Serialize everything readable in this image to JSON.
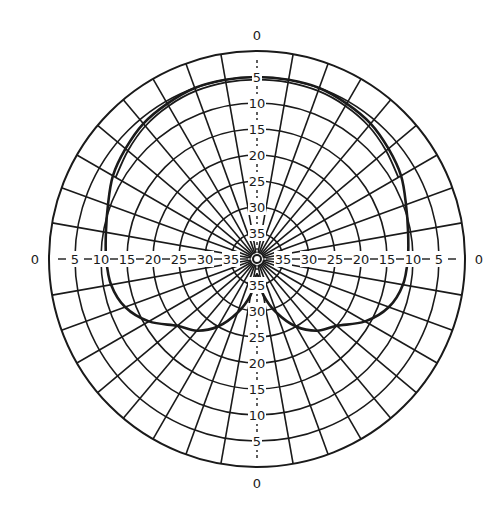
{
  "chart_data": {
    "type": "polar",
    "title": "",
    "radial_axis": {
      "unit": "dB",
      "direction": "inward",
      "outer_value": 0,
      "ticks": [
        0,
        5,
        10,
        15,
        20,
        25,
        30,
        35
      ],
      "range": [
        0,
        40
      ]
    },
    "angular_axis": {
      "grid_step_deg": 10,
      "zero_direction": "top",
      "direction": "clockwise"
    },
    "labels": {
      "top": "0",
      "bottom": "0",
      "left": "0",
      "right": "0",
      "ring_labels": [
        "5",
        "10",
        "15",
        "20",
        "25",
        "30",
        "35"
      ]
    },
    "series": [
      {
        "name": "pattern",
        "angles_deg": [
          0,
          10,
          20,
          30,
          40,
          50,
          60,
          70,
          80,
          90,
          100,
          110,
          120,
          130,
          140,
          150,
          160,
          170,
          180,
          190,
          200,
          210,
          220,
          230,
          240,
          250,
          260,
          270,
          280,
          290,
          300,
          310,
          320,
          330,
          340,
          350
        ],
        "attenuation_db": [
          5,
          5,
          5,
          5.5,
          6,
          7,
          8,
          9.5,
          10.5,
          11,
          11.5,
          13,
          16,
          20,
          22,
          25,
          29,
          33,
          37,
          33,
          29,
          25,
          22,
          20,
          16,
          13,
          11.5,
          11,
          10.5,
          9.5,
          8,
          7,
          6,
          5.5,
          5,
          5
        ]
      },
      {
        "name": "pattern-trace-2",
        "angles_deg": [
          300,
          310,
          320,
          330,
          340,
          350,
          0,
          10,
          20,
          30,
          40,
          50,
          60
        ],
        "attenuation_db": [
          8.6,
          7.6,
          6.6,
          6,
          5.6,
          5.5,
          5.5,
          5.5,
          5.6,
          6,
          6.6,
          7.6,
          8.6
        ]
      }
    ],
    "grid": true,
    "legend": "none"
  },
  "colors": {
    "grid": "#1a1a1a",
    "curve": "#1a1a1a",
    "background": "#ffffff"
  }
}
